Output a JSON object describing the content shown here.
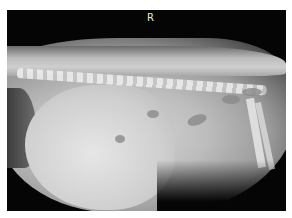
{
  "image": {
    "type": "radiograph",
    "view": "lateral",
    "marker_label": "R"
  }
}
